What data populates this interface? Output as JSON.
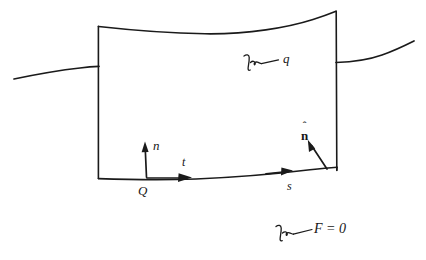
{
  "figure": {
    "kind": "hand-drawn-diagram",
    "background_color": "#ffffff",
    "ink_color": "#1a1a1a",
    "labels": {
      "normal_vector": "n",
      "tangent_vector": "t",
      "arclength": "s",
      "point": "Q",
      "heat_flux": "q",
      "unit_normal_base": "n",
      "unit_normal_hat": "ˆ",
      "surface_equation": "F = 0"
    },
    "annotations": [
      {
        "name": "q-callout",
        "text": "q",
        "leader": "squiggle"
      },
      {
        "name": "surface-callout",
        "text": "F = 0",
        "leader": "squiggle"
      }
    ],
    "vectors": [
      {
        "name": "n",
        "label": "n",
        "kind": "normal",
        "at": "Q"
      },
      {
        "name": "t",
        "label": "t",
        "kind": "tangent",
        "at": "Q"
      },
      {
        "name": "s",
        "label": "s",
        "kind": "arclength-direction"
      },
      {
        "name": "n-hat",
        "label": "n",
        "kind": "unit-normal"
      }
    ]
  }
}
